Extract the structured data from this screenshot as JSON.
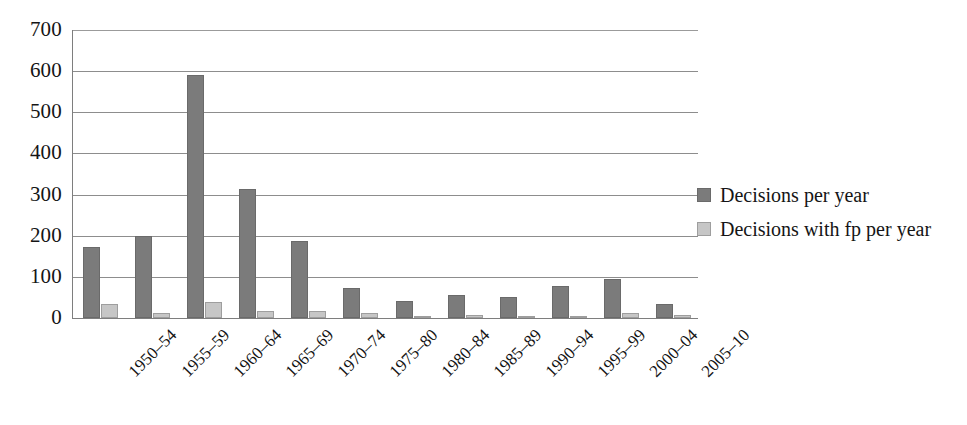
{
  "chart_data": {
    "type": "bar",
    "title": "",
    "xlabel": "",
    "ylabel": "",
    "ylim": [
      0,
      700
    ],
    "ytick_step": 100,
    "grid": true,
    "legend_position": "right",
    "categories": [
      "1950–54",
      "1955–59",
      "1960–64",
      "1965–69",
      "1970–74",
      "1975–80",
      "1980–84",
      "1985–89",
      "1990–94",
      "1995–99",
      "2000–04",
      "2005–10"
    ],
    "yticks": [
      "0",
      "100",
      "200",
      "300",
      "400",
      "500",
      "600",
      "700"
    ],
    "series": [
      {
        "name": "Decisions per year",
        "color": "#7b7b7b",
        "values": [
          172,
          200,
          590,
          314,
          186,
          72,
          42,
          56,
          52,
          78,
          95,
          35
        ]
      },
      {
        "name": "Decisions with fp per year",
        "color": "#c6c6c6",
        "values": [
          33,
          13,
          40,
          17,
          16,
          13,
          5,
          8,
          6,
          4,
          12,
          8
        ]
      }
    ]
  },
  "legend": {
    "items": [
      {
        "label": "Decisions per year",
        "swatch": "legend-swatch-dark"
      },
      {
        "label": "Decisions with fp per year",
        "swatch": "legend-swatch-light"
      }
    ]
  },
  "colors": {
    "series_main": "#7b7b7b",
    "series_fp": "#c6c6c6",
    "gridline": "#8d8d8d",
    "axis": "#7e7e7e",
    "text": "#151515",
    "background": "#ffffff"
  }
}
